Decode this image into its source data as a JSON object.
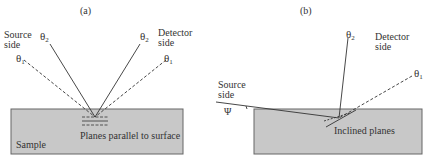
{
  "panels": {
    "a": {
      "label": "(a)",
      "source_side": [
        "Source",
        "side"
      ],
      "detector_side": [
        "Detector",
        "side"
      ],
      "theta1_left": "θ",
      "theta2_left": "θ",
      "theta1_right": "θ",
      "theta2_right": "θ",
      "sub1": "1",
      "sub2": "2",
      "planes_label": "Planes parallel to surface",
      "sample_label": "Sample"
    },
    "b": {
      "label": "(b)",
      "source_side": [
        "Source",
        "side"
      ],
      "detector_side": [
        "Detector",
        "side"
      ],
      "theta2": "θ",
      "theta1": "θ",
      "sub1": "1",
      "sub2": "2",
      "psi": "Ψ",
      "planes_label": "Inclined planes"
    }
  },
  "colors": {
    "sample_fill": "#c8c8c8",
    "sample_stroke": "#666666",
    "line": "#333333"
  }
}
